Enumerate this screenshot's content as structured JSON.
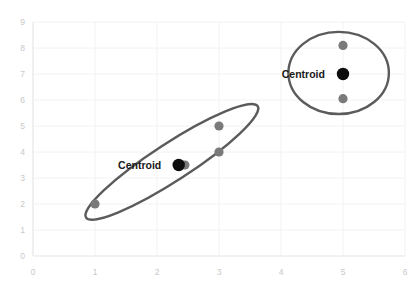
{
  "chart_data": {
    "type": "scatter",
    "title": "",
    "xlabel": "",
    "ylabel": "",
    "xlim": [
      0,
      6
    ],
    "ylim": [
      0,
      9
    ],
    "xticks": [
      "0",
      "1",
      "2",
      "3",
      "4",
      "5",
      "6"
    ],
    "yticks": [
      "0",
      "1",
      "2",
      "3",
      "4",
      "5",
      "6",
      "7",
      "8",
      "9"
    ],
    "grid": true,
    "legend": "none",
    "series": [
      {
        "name": "data points",
        "color": "#7a7a7a",
        "points": [
          {
            "x": 1.0,
            "y": 2.0
          },
          {
            "x": 2.45,
            "y": 3.5
          },
          {
            "x": 3.0,
            "y": 5.0
          },
          {
            "x": 3.0,
            "y": 4.0
          },
          {
            "x": 5.0,
            "y": 8.1
          },
          {
            "x": 5.0,
            "y": 6.05
          }
        ]
      },
      {
        "name": "centroids",
        "color": "#0d0d0d",
        "points": [
          {
            "x": 2.35,
            "y": 3.5,
            "label": "Centroid"
          },
          {
            "x": 5.0,
            "y": 7.0,
            "label": "Centroid"
          }
        ]
      }
    ],
    "clusters": [
      {
        "name": "left-cluster",
        "shape": "ellipse",
        "center": {
          "x": 2.24,
          "y": 3.62
        },
        "rx": 1.65,
        "ry": 0.72,
        "rotation_deg": -33,
        "stroke": "#5b5b5b"
      },
      {
        "name": "right-cluster",
        "shape": "ellipse",
        "center": {
          "x": 4.93,
          "y": 7.04
        },
        "rx": 0.81,
        "ry": 1.58,
        "rotation_deg": 0,
        "stroke": "#5b5b5b"
      }
    ],
    "annotations": [
      {
        "text": "Centroid",
        "x": 1.72,
        "y": 3.5,
        "anchor": "middle",
        "cluster": "left-cluster"
      },
      {
        "text": "Centroid",
        "x": 4.36,
        "y": 7.0,
        "anchor": "middle",
        "cluster": "right-cluster"
      }
    ]
  },
  "axes": {
    "x_tick_0": "0",
    "x_tick_1": "1",
    "x_tick_2": "2",
    "x_tick_3": "3",
    "x_tick_4": "4",
    "x_tick_5": "5",
    "x_tick_6": "6",
    "y_tick_0": "0",
    "y_tick_1": "1",
    "y_tick_2": "2",
    "y_tick_3": "3",
    "y_tick_4": "4",
    "y_tick_5": "5",
    "y_tick_6": "6",
    "y_tick_7": "7",
    "y_tick_8": "8",
    "y_tick_9": "9"
  },
  "labels": {
    "centroid_left": "Centroid",
    "centroid_right": "Centroid"
  }
}
